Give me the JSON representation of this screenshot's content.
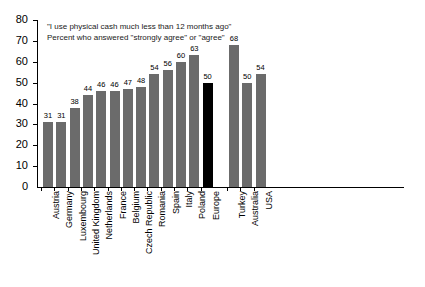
{
  "chart_data": {
    "type": "bar",
    "title": "\"I use physical cash much less than 12 months ago\"",
    "subtitle": "Percent who answered \"strongly agree\" or \"agree\"",
    "xlabel": "",
    "ylabel": "",
    "ylim": [
      0,
      80
    ],
    "ytick_step": 10,
    "yticks": [
      0,
      10,
      20,
      30,
      40,
      50,
      60,
      70,
      80
    ],
    "grid": false,
    "legend": "none",
    "categories": [
      "Austria",
      "Germany",
      "Luxembourg",
      "United Kingdom",
      "Netherlands",
      "France",
      "Belgium",
      "Czech Republic",
      "Romania",
      "Spain",
      "Italy",
      "Poland",
      "Europe",
      "Turkey",
      "Australia",
      "USA"
    ],
    "values": [
      31,
      31,
      38,
      44,
      46,
      46,
      47,
      48,
      54,
      56,
      60,
      63,
      50,
      68,
      50,
      54
    ],
    "bar_colors": [
      "#6b6b6b",
      "#6b6b6b",
      "#6b6b6b",
      "#6b6b6b",
      "#6b6b6b",
      "#6b6b6b",
      "#6b6b6b",
      "#6b6b6b",
      "#6b6b6b",
      "#6b6b6b",
      "#6b6b6b",
      "#6b6b6b",
      "#000000",
      "#6b6b6b",
      "#6b6b6b",
      "#6b6b6b"
    ],
    "highlight_category": "Europe",
    "gap_after_category": "Europe",
    "colors": {
      "bar_default": "#6b6b6b",
      "bar_highlight": "#000000",
      "axis": "#000000",
      "background": "#ffffff",
      "text": "#000000"
    }
  }
}
